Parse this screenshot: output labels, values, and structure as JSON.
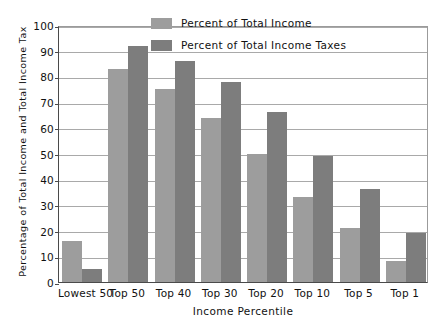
{
  "chart_data": {
    "type": "bar",
    "title": "",
    "xlabel": "Income Percentile",
    "ylabel": "Percentage of Total Income and Total Income Tax",
    "ylim": [
      0,
      100
    ],
    "ytick_step": 10,
    "yticks": [
      "100",
      "90",
      "80",
      "70",
      "60",
      "50",
      "40",
      "30",
      "20",
      "10",
      "0"
    ],
    "grid": true,
    "legend_position": "top-right-inside",
    "categories": [
      "Lowest 50",
      "Top 50",
      "Top 40",
      "Top 30",
      "Top 20",
      "Top 10",
      "Top 5",
      "Top 1"
    ],
    "series": [
      {
        "name": "Percent of Total Income",
        "color": "#9d9d9d",
        "values": [
          16,
          83,
          75,
          64,
          50,
          33,
          21,
          8
        ]
      },
      {
        "name": "Percent of Total Income Taxes",
        "color": "#7d7d7d",
        "values": [
          5,
          92,
          86,
          78,
          66,
          49,
          36,
          19
        ]
      }
    ]
  },
  "legend": {
    "items": [
      {
        "label": "Percent of Total Income",
        "swatch": "income"
      },
      {
        "label": "Percent of Total Income Taxes",
        "swatch": "taxes"
      }
    ]
  }
}
